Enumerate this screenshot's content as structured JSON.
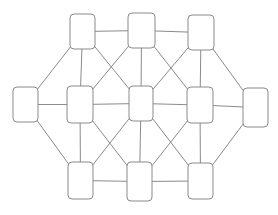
{
  "canvas": {
    "width": 278,
    "height": 215,
    "background": "#ffffff"
  },
  "diagram": {
    "type": "node-link-graph",
    "node_shape": "rounded-rectangle",
    "node_fill": "#ffffff",
    "stroke_color": "#8a8a8a",
    "edge_color": "#8a8a8a",
    "stroke_width": 1,
    "corner_radius": 4,
    "node_count": 11,
    "edge_count": 26,
    "nodes": [
      {
        "id": "top-left",
        "label": "",
        "x": 70,
        "y": 14,
        "w": 25,
        "h": 35
      },
      {
        "id": "top-center",
        "label": "",
        "x": 128,
        "y": 13,
        "w": 27,
        "h": 35
      },
      {
        "id": "top-right",
        "label": "",
        "x": 188,
        "y": 15,
        "w": 26,
        "h": 35
      },
      {
        "id": "mid-far-left",
        "label": "",
        "x": 13,
        "y": 87,
        "w": 25,
        "h": 35
      },
      {
        "id": "mid-left",
        "label": "",
        "x": 67,
        "y": 86,
        "w": 26,
        "h": 37
      },
      {
        "id": "mid-center",
        "label": "",
        "x": 129,
        "y": 86,
        "w": 24,
        "h": 35
      },
      {
        "id": "mid-right",
        "label": "",
        "x": 187,
        "y": 87,
        "w": 26,
        "h": 36
      },
      {
        "id": "mid-far-right",
        "label": "",
        "x": 243,
        "y": 88,
        "w": 25,
        "h": 39
      },
      {
        "id": "bottom-left",
        "label": "",
        "x": 68,
        "y": 162,
        "w": 25,
        "h": 37
      },
      {
        "id": "bottom-center",
        "label": "",
        "x": 127,
        "y": 162,
        "w": 25,
        "h": 39
      },
      {
        "id": "bottom-right",
        "label": "",
        "x": 188,
        "y": 163,
        "w": 25,
        "h": 36
      }
    ],
    "edges": [
      [
        "top-left",
        "top-center"
      ],
      [
        "top-center",
        "top-right"
      ],
      [
        "top-left",
        "mid-far-left"
      ],
      [
        "top-left",
        "mid-left"
      ],
      [
        "top-left",
        "mid-center"
      ],
      [
        "top-center",
        "mid-left"
      ],
      [
        "top-center",
        "mid-center"
      ],
      [
        "top-center",
        "mid-right"
      ],
      [
        "top-right",
        "mid-center"
      ],
      [
        "top-right",
        "mid-right"
      ],
      [
        "top-right",
        "mid-far-right"
      ],
      [
        "mid-far-left",
        "mid-left"
      ],
      [
        "mid-left",
        "mid-center"
      ],
      [
        "mid-center",
        "mid-right"
      ],
      [
        "mid-right",
        "mid-far-right"
      ],
      [
        "mid-far-left",
        "bottom-left"
      ],
      [
        "mid-left",
        "bottom-left"
      ],
      [
        "mid-left",
        "bottom-center"
      ],
      [
        "mid-center",
        "bottom-left"
      ],
      [
        "mid-center",
        "bottom-center"
      ],
      [
        "mid-center",
        "bottom-right"
      ],
      [
        "mid-right",
        "bottom-center"
      ],
      [
        "mid-right",
        "bottom-right"
      ],
      [
        "mid-far-right",
        "bottom-right"
      ],
      [
        "bottom-left",
        "bottom-center"
      ],
      [
        "bottom-center",
        "bottom-right"
      ]
    ]
  }
}
